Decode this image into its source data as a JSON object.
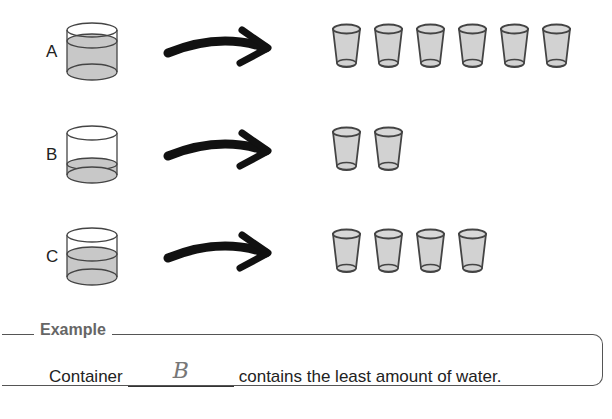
{
  "rows": [
    {
      "label": "A",
      "water_level": "high",
      "cups": 6
    },
    {
      "label": "B",
      "water_level": "low",
      "cups": 2
    },
    {
      "label": "C",
      "water_level": "medium",
      "cups": 4
    }
  ],
  "example": {
    "title": "Example",
    "prefix": "Container",
    "answer": "B",
    "suffix": "contains the least amount of water."
  },
  "colors": {
    "water": "#c8c8c8",
    "outline": "#444444",
    "arrow": "#111111"
  }
}
